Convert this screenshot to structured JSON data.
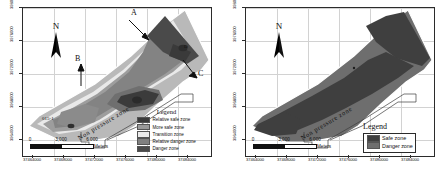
{
  "figure": {
    "panels": [
      {
        "id": "left",
        "name": "five-class-risk-map",
        "north_label": "N",
        "zone_label": "Non pressure zone",
        "site_label": "015-1",
        "annotations": [
          {
            "text": "A"
          },
          {
            "text": "B"
          },
          {
            "text": "C"
          },
          {
            "text": "D"
          }
        ],
        "legend": {
          "title": "Legend",
          "items": [
            {
              "label": "Relative safe zone",
              "color": "#3a3a3a"
            },
            {
              "label": "More safe zone",
              "color": "#9a9a9a"
            },
            {
              "label": "Transition zone",
              "color": "#ececec"
            },
            {
              "label": "Relative danger zone",
              "color": "#808080"
            },
            {
              "label": "Danger zone",
              "color": "#4a4a4a"
            }
          ]
        },
        "scalebar": {
          "ticks": [
            "0",
            "3,000",
            "6,000"
          ],
          "unit": "Meters"
        },
        "xaxis": {
          "ticks": [
            "37464000",
            "37468000",
            "37472000",
            "37476000",
            "37480000",
            "37484000"
          ]
        },
        "yaxis": {
          "ticks": [
            "3980000",
            "3976000",
            "3972000",
            "3968000",
            "3964000"
          ]
        }
      },
      {
        "id": "right",
        "name": "two-class-risk-map",
        "north_label": "N",
        "zone_label": "Non pressure zone",
        "legend": {
          "title": "Legend",
          "items": [
            {
              "label": "Safe zone",
              "color": "#3f3f3f"
            },
            {
              "label": "Danger zone",
              "color": "#6e6e6e"
            }
          ]
        },
        "scalebar": {
          "ticks": [
            "0",
            "3,000",
            "6,000"
          ],
          "unit": "Meters"
        },
        "xaxis": {
          "ticks": [
            "37464000",
            "37468000",
            "37472000",
            "37476000",
            "37480000",
            "37484000"
          ]
        },
        "yaxis": {
          "ticks": [
            "3980000",
            "3976000",
            "3972000",
            "3968000",
            "3964000"
          ]
        }
      }
    ]
  }
}
